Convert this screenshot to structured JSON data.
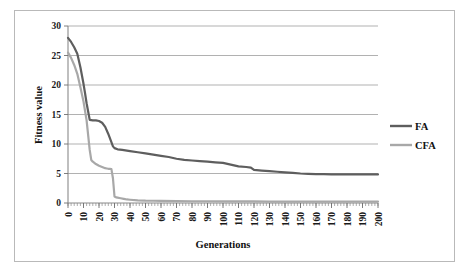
{
  "chart_data": {
    "type": "line",
    "title": "",
    "xlabel": "Generations",
    "ylabel": "Fitness value",
    "xlim": [
      0,
      200
    ],
    "ylim": [
      0,
      30
    ],
    "grid": true,
    "grid_axis": "y",
    "legend_position": "right",
    "y_ticks": [
      0,
      5,
      10,
      15,
      20,
      25,
      30
    ],
    "y_tick_labels": [
      "0",
      "5",
      "10",
      "15",
      "20",
      "25",
      "30"
    ],
    "x_ticks": [
      0,
      10,
      20,
      30,
      40,
      50,
      60,
      70,
      80,
      90,
      100,
      110,
      120,
      130,
      140,
      150,
      160,
      170,
      180,
      190,
      200
    ],
    "x_tick_labels": [
      "0",
      "10",
      "20",
      "30",
      "40",
      "50",
      "60",
      "70",
      "80",
      "90",
      "100",
      "110",
      "120",
      "130",
      "140",
      "150",
      "160",
      "170",
      "180",
      "190",
      "200"
    ],
    "x_tick_label_rotation": -90,
    "series": [
      {
        "name": "FA",
        "color": "#5e5e5e",
        "line_width": 2.2,
        "x": [
          0,
          2,
          4,
          6,
          8,
          10,
          11,
          12,
          14,
          16,
          18,
          20,
          22,
          24,
          26,
          28,
          29,
          30,
          32,
          35,
          40,
          45,
          50,
          55,
          60,
          65,
          70,
          75,
          80,
          85,
          90,
          95,
          100,
          105,
          110,
          115,
          118,
          120,
          125,
          130,
          135,
          140,
          145,
          150,
          155,
          160,
          165,
          170,
          175,
          180,
          185,
          190,
          195,
          200
        ],
        "y": [
          28.0,
          27.3,
          26.4,
          25.3,
          23.0,
          20.2,
          18.6,
          16.9,
          14.1,
          14.0,
          14.0,
          13.9,
          13.6,
          12.9,
          11.7,
          10.3,
          9.6,
          9.3,
          9.1,
          9.0,
          8.8,
          8.6,
          8.4,
          8.2,
          8.0,
          7.8,
          7.5,
          7.3,
          7.2,
          7.1,
          7.0,
          6.9,
          6.8,
          6.5,
          6.2,
          6.1,
          6.0,
          5.6,
          5.5,
          5.4,
          5.3,
          5.2,
          5.1,
          5.0,
          4.95,
          4.9,
          4.9,
          4.85,
          4.85,
          4.85,
          4.85,
          4.85,
          4.85,
          4.85
        ]
      },
      {
        "name": "CFA",
        "color": "#a8a8a8",
        "line_width": 2.2,
        "x": [
          0,
          2,
          4,
          6,
          8,
          10,
          12,
          14,
          15,
          16,
          18,
          20,
          22,
          24,
          25,
          26,
          27,
          28,
          29,
          30,
          31,
          32,
          34,
          36,
          38,
          40,
          45,
          50,
          55,
          60,
          70,
          80,
          90,
          100,
          110,
          120,
          130,
          140,
          150,
          160,
          170,
          180,
          190,
          200
        ],
        "y": [
          25.5,
          24.6,
          23.4,
          21.9,
          19.6,
          17.2,
          14.0,
          9.0,
          7.3,
          7.0,
          6.6,
          6.3,
          6.1,
          5.9,
          5.85,
          5.8,
          5.8,
          5.75,
          4.2,
          1.1,
          0.95,
          0.9,
          0.8,
          0.7,
          0.6,
          0.55,
          0.45,
          0.4,
          0.38,
          0.35,
          0.32,
          0.3,
          0.3,
          0.28,
          0.27,
          0.26,
          0.25,
          0.25,
          0.24,
          0.24,
          0.23,
          0.23,
          0.22,
          0.22
        ]
      }
    ]
  },
  "legend": {
    "entries": [
      {
        "label": "FA",
        "color": "#5e5e5e"
      },
      {
        "label": "CFA",
        "color": "#a8a8a8"
      }
    ]
  },
  "axes": {
    "y_axis_title": "Fitness value",
    "x_axis_title": "Generations"
  },
  "colors": {
    "fa_series": "#5e5e5e",
    "cfa_series": "#a8a8a8",
    "gridline": "#a8a8a8",
    "frame_border": "#b9b9b9",
    "text": "#111111",
    "background": "#ffffff"
  }
}
